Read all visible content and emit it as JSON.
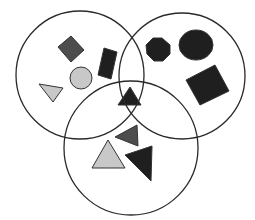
{
  "diagram": {
    "type": "venn",
    "sets": [
      {
        "name": "left-set",
        "cx": 80,
        "cy": 75,
        "r": 64
      },
      {
        "name": "right-set",
        "cx": 182,
        "cy": 76,
        "r": 63
      },
      {
        "name": "bottom-set",
        "cx": 131,
        "cy": 148,
        "r": 67
      }
    ],
    "colors": {
      "stroke": "#2a2a2a",
      "dark": "#1f1f1f",
      "mid": "#4d4d4d",
      "light": "#c8c8c8",
      "background": "#ffffff"
    },
    "shapes": [
      {
        "name": "mid-gray-diamond",
        "region": "left",
        "kind": "polygon",
        "points": "58,47 71,36 84,50 71,62",
        "fill": "mid"
      },
      {
        "name": "dark-tilted-rectangle",
        "region": "left",
        "kind": "polygon",
        "points": "104,48 117,52 111,79 98,75",
        "fill": "dark"
      },
      {
        "name": "light-gray-circle",
        "region": "left",
        "kind": "circle",
        "cx": 81,
        "cy": 78,
        "r": 11,
        "fill": "light"
      },
      {
        "name": "light-gray-triangle-down",
        "region": "left",
        "kind": "polygon",
        "points": "39,84 63,88 53,102",
        "fill": "light"
      },
      {
        "name": "dark-octagon",
        "region": "right",
        "kind": "polygon",
        "points": "153,38 162,38 170,45 170,54 163,61 154,61 147,54 146,45",
        "fill": "dark"
      },
      {
        "name": "dark-ellipse",
        "region": "right",
        "kind": "ellipse",
        "cx": 196,
        "cy": 45,
        "rx": 17,
        "ry": 15,
        "fill": "dark"
      },
      {
        "name": "dark-rotated-square",
        "region": "right",
        "kind": "polygon",
        "points": "186,80 215,65 229,91 200,105",
        "fill": "dark"
      },
      {
        "name": "dark-triangle-center",
        "region": "all-three",
        "kind": "polygon",
        "points": "118,105 130,87 141,105",
        "fill": "dark"
      },
      {
        "name": "mid-gray-triangle-small",
        "region": "bottom",
        "kind": "polygon",
        "points": "115,137 137,125 138,146",
        "fill": "mid"
      },
      {
        "name": "light-gray-triangle-up",
        "region": "bottom",
        "kind": "polygon",
        "points": "92,168 108,140 125,168",
        "fill": "light"
      },
      {
        "name": "dark-triangle-large",
        "region": "bottom",
        "kind": "polygon",
        "points": "125,155 152,146 151,181",
        "fill": "dark"
      }
    ]
  }
}
